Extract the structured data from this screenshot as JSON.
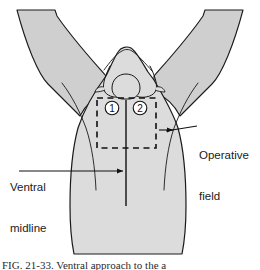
{
  "figure": {
    "type": "anatomical-diagram",
    "view": "ventral view of animal hindquarters with limbs abducted",
    "background_color": "#ffffff",
    "body_fill_color": "#dcdcdc",
    "limb_fill_color": "#cfcfcf",
    "outline_color": "#1a1a1a",
    "line_color": "#111111"
  },
  "labels": {
    "operative_field": {
      "line1": "Operative",
      "line2": "field"
    },
    "ventral_midline": {
      "line1": "Ventral",
      "line2": "midline"
    }
  },
  "markers": [
    {
      "id": "marker-1",
      "text": "1",
      "cx": 112,
      "cy": 108,
      "r": 7
    },
    {
      "id": "marker-2",
      "text": "2",
      "cx": 140,
      "cy": 108,
      "r": 7
    }
  ],
  "operative_field_box": {
    "x": 97,
    "y": 98,
    "width": 59,
    "height": 50,
    "stroke_style": "dashed"
  },
  "midline": {
    "x": 126,
    "y_top": 100,
    "y_bottom": 206
  },
  "leader_lines": {
    "operative_field": {
      "from_x": 196,
      "from_y": 128,
      "to_x": 157,
      "to_y": 130,
      "arrow": "left"
    },
    "ventral_midline": {
      "from_x": 19,
      "from_y": 171,
      "to_x": 126,
      "to_y": 171,
      "arrow": "right"
    }
  },
  "caption": {
    "text": "FIG. 21-33. Ventral approach to the a"
  }
}
